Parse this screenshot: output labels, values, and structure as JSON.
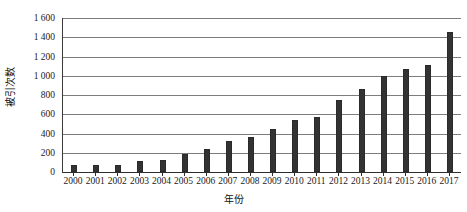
{
  "chart_data": {
    "type": "bar",
    "title": "",
    "xlabel": "年份",
    "ylabel": "被引次数",
    "categories": [
      "2000",
      "2001",
      "2002",
      "2003",
      "2004",
      "2005",
      "2006",
      "2007",
      "2008",
      "2009",
      "2010",
      "2011",
      "2012",
      "2013",
      "2014",
      "2015",
      "2016",
      "2017"
    ],
    "values": [
      70,
      72,
      75,
      110,
      128,
      192,
      238,
      325,
      365,
      450,
      540,
      575,
      745,
      860,
      1000,
      1075,
      1110,
      1450
    ],
    "ylim": [
      0,
      1600
    ],
    "ytick_values": [
      0,
      200,
      400,
      600,
      800,
      1000,
      1200,
      1400,
      1600
    ],
    "ytick_labels": [
      "0",
      "200",
      "400",
      "600",
      "800",
      "1 000",
      "1 200",
      "1 400",
      "1 600"
    ],
    "grid": true,
    "legend": "none",
    "bar_color": "#333333",
    "grid_color": "#7d7d7d",
    "axis_color": "#2e2e2e"
  }
}
